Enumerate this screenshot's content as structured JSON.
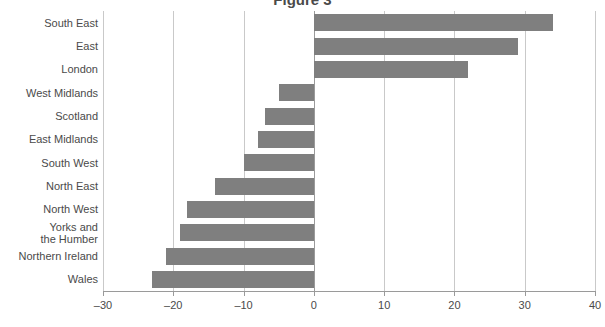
{
  "title_fragment": "Figure 3",
  "chart_data": {
    "type": "bar",
    "orientation": "horizontal",
    "title": "",
    "xlabel": "",
    "ylabel": "",
    "xlim": [
      -30,
      40
    ],
    "xticks": [
      -30,
      -20,
      -10,
      0,
      10,
      20,
      30,
      40
    ],
    "xtick_labels": [
      "–30",
      "–20",
      "–10",
      "0",
      "10",
      "20",
      "30",
      "40"
    ],
    "grid": true,
    "legend": "none",
    "bar_color": "#7f7f7f",
    "categories": [
      "South East",
      "East",
      "London",
      "West Midlands",
      "Scotland",
      "East Midlands",
      "South West",
      "North East",
      "North West",
      "Yorks and\nthe Humber",
      "Northern Ireland",
      "Wales"
    ],
    "values": [
      34,
      29,
      22,
      -5,
      -7,
      -8,
      -10,
      -14,
      -18,
      -19,
      -21,
      -23
    ]
  },
  "categories_display": [
    {
      "label": "South East",
      "line1": "South East",
      "line2": ""
    },
    {
      "label": "East",
      "line1": "East",
      "line2": ""
    },
    {
      "label": "London",
      "line1": "London",
      "line2": ""
    },
    {
      "label": "West Midlands",
      "line1": "West Midlands",
      "line2": ""
    },
    {
      "label": "Scotland",
      "line1": "Scotland",
      "line2": ""
    },
    {
      "label": "East Midlands",
      "line1": "East Midlands",
      "line2": ""
    },
    {
      "label": "South West",
      "line1": "South West",
      "line2": ""
    },
    {
      "label": "North East",
      "line1": "North East",
      "line2": ""
    },
    {
      "label": "North West",
      "line1": "North West",
      "line2": ""
    },
    {
      "label": "Yorks and the Humber",
      "line1": "Yorks and",
      "line2": "the Humber"
    },
    {
      "label": "Northern Ireland",
      "line1": "Northern Ireland",
      "line2": ""
    },
    {
      "label": "Wales",
      "line1": "Wales",
      "line2": ""
    }
  ]
}
